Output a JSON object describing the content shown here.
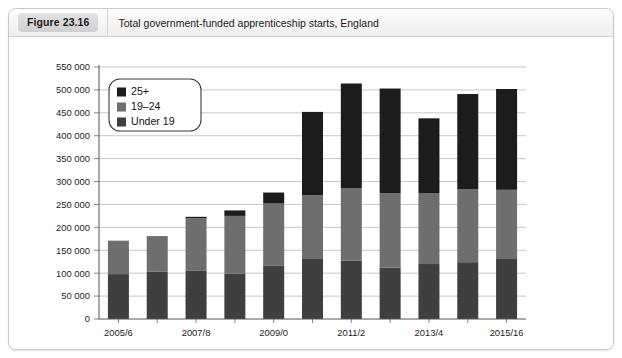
{
  "caption": {
    "figure_badge": "Figure 23.16",
    "title": "Total government-funded apprenticeship starts, England"
  },
  "chart_data": {
    "type": "bar",
    "stacked": true,
    "title": "Total government-funded apprenticeship starts, England",
    "xlabel": "",
    "ylabel": "",
    "grid": true,
    "legend_position": "top-left-inside",
    "ylim": [
      0,
      550000
    ],
    "ytick_step": 50000,
    "ytick_labels": [
      "0",
      "50 000",
      "100 000",
      "150 000",
      "200 000",
      "250 000",
      "300 000",
      "350 000",
      "400 000",
      "450 000",
      "500 000",
      "550 000"
    ],
    "ytick_values": [
      0,
      50000,
      100000,
      150000,
      200000,
      250000,
      300000,
      350000,
      400000,
      450000,
      500000,
      550000
    ],
    "categories": [
      "2005/6",
      "2006/7",
      "2007/8",
      "2008/9",
      "2009/0",
      "2010/11",
      "2011/2",
      "2012/13",
      "2013/4",
      "2014/15",
      "2015/16"
    ],
    "xtick_labels_shown": [
      "2005/6",
      "",
      "2007/8",
      "",
      "2009/0",
      "",
      "2011/2",
      "",
      "2013/4",
      "",
      "2015/16"
    ],
    "series": [
      {
        "name": "Under 19",
        "color": "#3f3f3f",
        "values": [
          98000,
          103000,
          105000,
          99000,
          117000,
          131000,
          127000,
          112000,
          120000,
          124000,
          131000
        ]
      },
      {
        "name": "19–24",
        "color": "#6e6e6e",
        "values": [
          73000,
          78000,
          115000,
          126000,
          135000,
          139000,
          158000,
          163000,
          155000,
          159000,
          151000
        ]
      },
      {
        "name": "25+",
        "color": "#1c1c1c",
        "values": [
          0,
          0,
          3000,
          12000,
          24000,
          182000,
          229000,
          228000,
          163000,
          208000,
          220000
        ]
      }
    ],
    "totals": [
      171000,
      181000,
      223000,
      237000,
      276000,
      452000,
      514000,
      503000,
      438000,
      491000,
      502000
    ],
    "legend": [
      {
        "label": "25+",
        "color": "#1c1c1c"
      },
      {
        "label": "19–24",
        "color": "#6e6e6e"
      },
      {
        "label": "Under 19",
        "color": "#3f3f3f"
      }
    ]
  }
}
